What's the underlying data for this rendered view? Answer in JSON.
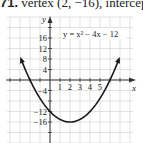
{
  "header": {
    "problem_number": "71.",
    "text": "vertex (2, −16), intercep"
  },
  "chart_data": {
    "type": "line",
    "title": "",
    "equation": "y = x² − 4x − 12",
    "xlabel": "x",
    "ylabel": "y",
    "x_tick_labels": [
      "1",
      "2",
      "3",
      "4",
      "5"
    ],
    "y_tick_labels": [
      "16",
      "12",
      "8",
      "4",
      "-4",
      "-12",
      "-16"
    ],
    "xlim": [
      -4.3,
      8.2
    ],
    "ylim": [
      -24,
      24
    ],
    "grid": true,
    "vertex": [
      2,
      -16
    ],
    "series": [
      {
        "name": "y = x^2 - 4x - 12",
        "x": [
          -2.9,
          -2,
          -1,
          0,
          1,
          2,
          3,
          4,
          5,
          6,
          6.9
        ],
        "y": [
          5.4,
          0,
          -7,
          -12,
          -15,
          -16,
          -15,
          -12,
          -7,
          0,
          7.0
        ]
      }
    ]
  }
}
